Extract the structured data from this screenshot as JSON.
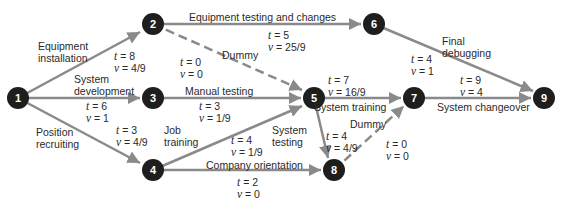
{
  "colors": {
    "node": "#1e1e1e",
    "edge": "#8a8a8a",
    "text": "#2a2a2a",
    "node_text": "#ffffff"
  },
  "nodes": [
    {
      "id": "1",
      "label": "1",
      "x": 18,
      "y": 98
    },
    {
      "id": "2",
      "label": "2",
      "x": 153,
      "y": 24
    },
    {
      "id": "3",
      "label": "3",
      "x": 153,
      "y": 98
    },
    {
      "id": "4",
      "label": "4",
      "x": 153,
      "y": 170
    },
    {
      "id": "5",
      "label": "5",
      "x": 314,
      "y": 98
    },
    {
      "id": "6",
      "label": "6",
      "x": 374,
      "y": 24
    },
    {
      "id": "7",
      "label": "7",
      "x": 414,
      "y": 98
    },
    {
      "id": "8",
      "label": "8",
      "x": 334,
      "y": 170
    },
    {
      "id": "9",
      "label": "9",
      "x": 544,
      "y": 98
    }
  ],
  "edges": [
    {
      "from": "1",
      "to": "2",
      "name": "Equipment installation",
      "t": "t = 8",
      "v": "v = 4/9",
      "dashed": false
    },
    {
      "from": "1",
      "to": "3",
      "name": "System development",
      "t": "t = 6",
      "v": "v = 1",
      "dashed": false
    },
    {
      "from": "1",
      "to": "4",
      "name": "Position recruiting",
      "t": "t = 3",
      "v": "v = 4/9",
      "dashed": false
    },
    {
      "from": "2",
      "to": "6",
      "name": "Equipment testing and changes",
      "t": "t = 5",
      "v": "v = 25/9",
      "dashed": false
    },
    {
      "from": "2",
      "to": "5",
      "name": "Dummy",
      "t": "t = 0",
      "v": "v = 0",
      "dashed": true
    },
    {
      "from": "3",
      "to": "5",
      "name": "Manual testing",
      "t": "t = 3",
      "v": "v = 1/9",
      "dashed": false
    },
    {
      "from": "4",
      "to": "5",
      "name": "Job training",
      "t": "t = 4",
      "v": "v = 1/9",
      "dashed": false
    },
    {
      "from": "4",
      "to": "8",
      "name": "Company orientation",
      "t": "t = 2",
      "v": "v = 0",
      "dashed": false
    },
    {
      "from": "5",
      "to": "7",
      "name": "System training",
      "t": "t = 7",
      "v": "v = 16/9",
      "dashed": false
    },
    {
      "from": "5",
      "to": "8",
      "name": "System testing",
      "t": "t = 4",
      "v": "v = 4/9",
      "dashed": false
    },
    {
      "from": "8",
      "to": "7",
      "name": "Dummy",
      "t": "t = 0",
      "v": "v = 0",
      "dashed": true
    },
    {
      "from": "6",
      "to": "9",
      "name": "Final debugging",
      "t": "t = 4",
      "v": "v = 1",
      "dashed": false
    },
    {
      "from": "7",
      "to": "9",
      "name": "System changeover",
      "t": "t = 9",
      "v": "v = 4",
      "dashed": false
    }
  ],
  "labels": {
    "e12_a": "Equipment",
    "e12_b": "installation",
    "e13_a": "System",
    "e13_b": "development",
    "e14_a": "Position",
    "e14_b": "recruiting",
    "e26": "Equipment testing and changes",
    "e25": "Dummy",
    "e35": "Manual testing",
    "e45_a": "Job",
    "e45_b": "training",
    "e48": "Company orientation",
    "e57": "System training",
    "e58_a": "System",
    "e58_b": "testing",
    "e87": "Dummy",
    "e69_a": "Final",
    "e69_b": "debugging",
    "e79": "System changeover"
  },
  "tv": {
    "e12_t": "= 8",
    "e12_v": "= 4/9",
    "e13_t": "= 6",
    "e13_v": "= 1",
    "e14_t": "= 3",
    "e14_v": "= 4/9",
    "e26_t": "= 5",
    "e26_v": "= 25/9",
    "e25_t": "= 0",
    "e25_v": "= 0",
    "e35_t": "= 3",
    "e35_v": "= 1/9",
    "e45_t": "= 4",
    "e45_v": "= 1/9",
    "e48_t": "= 2",
    "e48_v": "= 0",
    "e57_t": "= 7",
    "e57_v": "= 16/9",
    "e58_t": "= 4",
    "e58_v": "= 4/9",
    "e87_t": "= 0",
    "e87_v": "= 0",
    "e69_t": "= 4",
    "e69_v": "= 1",
    "e79_t": "= 9",
    "e79_v": "= 4"
  },
  "sym": {
    "t": "t",
    "v": "v"
  }
}
